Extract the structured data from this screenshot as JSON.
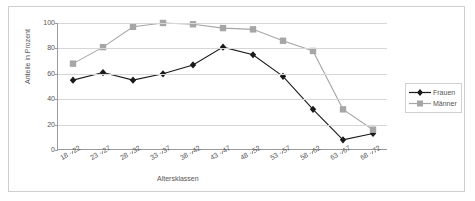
{
  "chart_data": {
    "type": "line",
    "title": "",
    "xlabel": "Altersklassen",
    "ylabel": "Anteile in Prozent",
    "ylim": [
      0,
      100
    ],
    "yticks": [
      0,
      20,
      40,
      60,
      80,
      100
    ],
    "grid": true,
    "legend_position": "right",
    "categories": [
      "18 - 22",
      "23 - 27",
      "28 - 32",
      "33 - 37",
      "38 - 42",
      "43 - 47",
      "48 - 52",
      "53 - 57",
      "58 - 62",
      "63 - 67",
      "68 - 72"
    ],
    "series": [
      {
        "name": "Frauen",
        "color": "#1a1a1a",
        "marker": "diamond",
        "values": [
          55,
          61,
          55,
          60,
          67,
          81,
          75,
          58,
          32,
          8,
          13
        ]
      },
      {
        "name": "Männer",
        "color": "#a6a6a6",
        "marker": "square",
        "values": [
          68,
          81,
          97,
          100,
          99,
          96,
          95,
          86,
          78,
          32,
          16
        ]
      }
    ]
  },
  "legend": {
    "items": [
      {
        "label": "Frauen"
      },
      {
        "label": "Männer"
      }
    ]
  },
  "colors": {
    "frauen": "#1a1a1a",
    "maenner": "#a6a6a6",
    "axis": "#9a9a9a",
    "grid": "#d6d6d6",
    "frame": "#cfcfcf",
    "text": "#555555"
  }
}
